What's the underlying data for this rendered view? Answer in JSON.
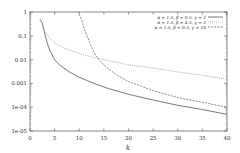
{
  "chart_data": {
    "type": "line",
    "title": "",
    "xlabel": "k",
    "ylabel": "",
    "xlim": [
      0,
      40
    ],
    "ylim": [
      1e-05,
      1
    ],
    "yscale": "log",
    "grid": false,
    "legend_position": "upper right",
    "x_ticks": [
      "0",
      "5",
      "10",
      "15",
      "20",
      "25",
      "30",
      "35",
      "40"
    ],
    "y_ticks": [
      "1e-05",
      "1e-04",
      "0.001",
      "0.01",
      "0.1",
      "1"
    ],
    "series": [
      {
        "name": "α = 1.5, β = 0.5, γ = 2",
        "style": "solid",
        "x": [
          2,
          2.5,
          3,
          3.5,
          4,
          5,
          6,
          8,
          10,
          13,
          16,
          20,
          25,
          30,
          35,
          40
        ],
        "values": [
          0.5,
          0.35,
          0.12,
          0.05,
          0.025,
          0.01,
          0.006,
          0.003,
          0.0018,
          0.001,
          0.0006,
          0.00035,
          0.0002,
          0.00012,
          8e-05,
          5e-05
        ]
      },
      {
        "name": "α = 1.5, β = 4.5, γ = 5",
        "style": "dotted",
        "x": [
          3,
          4,
          5,
          7,
          10,
          13,
          15,
          20,
          25,
          30,
          35,
          40
        ],
        "values": [
          0.15,
          0.08,
          0.05,
          0.03,
          0.018,
          0.012,
          0.01,
          0.006,
          0.0045,
          0.003,
          0.0022,
          0.0015
        ]
      },
      {
        "name": "α = 1.5, β = 0.5, γ = 10",
        "style": "dashed",
        "x": [
          10,
          10.5,
          11,
          12,
          13,
          14,
          15,
          16,
          18,
          20,
          25,
          30,
          35,
          40
        ],
        "values": [
          0.8,
          0.45,
          0.2,
          0.06,
          0.02,
          0.01,
          0.006,
          0.004,
          0.002,
          0.0012,
          0.0005,
          0.00025,
          0.00016,
          0.0001
        ]
      }
    ]
  }
}
